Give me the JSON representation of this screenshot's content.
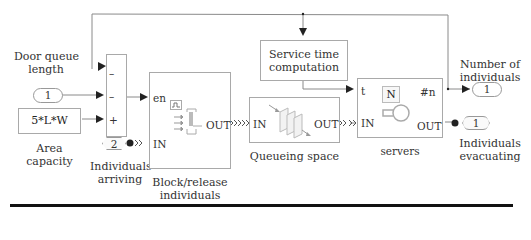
{
  "diagram": {
    "type": "simulink-simevents-model",
    "inputs": {
      "door_queue": {
        "label_line1": "Door queue",
        "label_line2": "length",
        "port_number": "1"
      },
      "area_capacity": {
        "expression": "5*L*W",
        "label_line1": "Area",
        "label_line2": "capacity"
      },
      "individuals_arriving": {
        "port_number": "2",
        "label_line1": "Individuals",
        "label_line2": "arriving"
      }
    },
    "sum_block": {
      "signs": [
        "–",
        "–",
        "+"
      ]
    },
    "block_release": {
      "ports": {
        "en": "en",
        "in": "IN",
        "out": "OUT"
      },
      "label_line1": "Block/release",
      "label_line2": "individuals"
    },
    "queue": {
      "ports": {
        "in": "IN",
        "out": "OUT"
      },
      "label": "Queueing space"
    },
    "service_time": {
      "label_line1": "Service time",
      "label_line2": "computation"
    },
    "servers": {
      "ports": {
        "t": "t",
        "in": "IN",
        "n": "#n",
        "out": "OUT"
      },
      "param": "N",
      "label": "servers"
    },
    "outputs": {
      "number_of_individuals": {
        "label_line1": "Number of",
        "label_line2": "individuals",
        "port_number": "1"
      },
      "individuals_evacuating": {
        "label_line1": "Individuals",
        "label_line2": "evacuating",
        "port_number": "1"
      }
    },
    "colors": {
      "wire": "#8a8a8a",
      "arrow": "#222222",
      "block_border": "#a9a9a9",
      "rule": "#111111"
    }
  }
}
